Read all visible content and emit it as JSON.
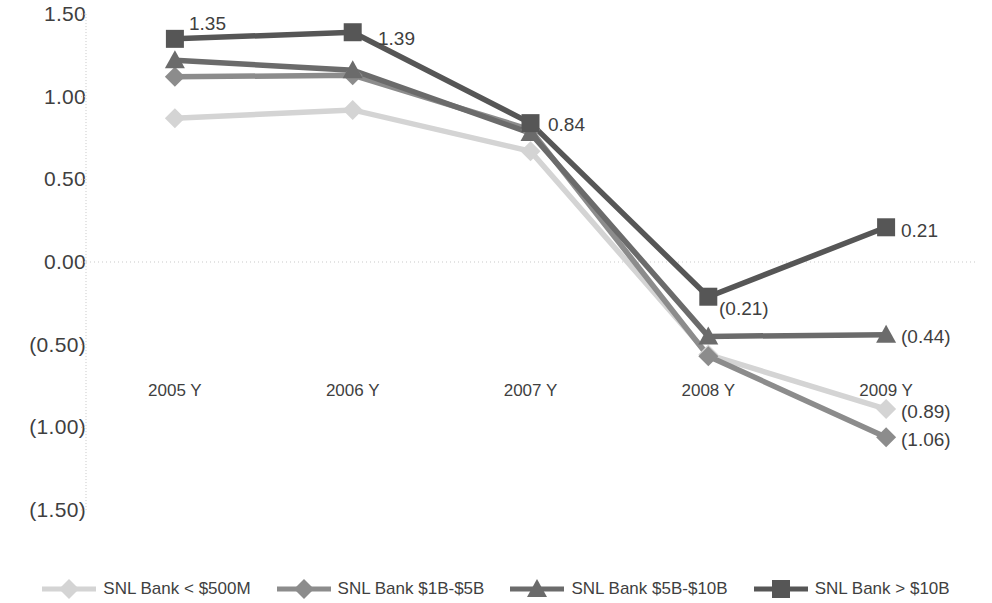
{
  "chart_data": {
    "type": "line",
    "title": "",
    "subtitle": "",
    "xlabel": "",
    "ylabel": "",
    "categories": [
      "2005 Y",
      "2006 Y",
      "2007 Y",
      "2008 Y",
      "2009 Y"
    ],
    "ylim": [
      -1.5,
      1.5
    ],
    "ytick_values": [
      1.5,
      1.0,
      0.5,
      0.0,
      -0.5,
      -1.0,
      -1.5
    ],
    "ytick_labels": [
      "1.50",
      "1.00",
      "0.50",
      "0.00",
      "(0.50)",
      "(1.00)",
      "(1.50)"
    ],
    "grid": false,
    "zero_line": true,
    "legend_position": "bottom",
    "series": [
      {
        "name": "SNL Bank < $500M",
        "color": "#d4d4d4",
        "marker": "diamond",
        "values": [
          0.87,
          0.92,
          0.67,
          -0.56,
          -0.89
        ]
      },
      {
        "name": "SNL Bank $1B-$5B",
        "color": "#8c8c8c",
        "marker": "diamond",
        "values": [
          1.12,
          1.13,
          0.8,
          -0.57,
          -1.06
        ]
      },
      {
        "name": "SNL Bank $5B-$10B",
        "color": "#6b6b6b",
        "marker": "triangle",
        "values": [
          1.22,
          1.16,
          0.78,
          -0.45,
          -0.44
        ]
      },
      {
        "name": "SNL Bank > $10B",
        "color": "#565656",
        "marker": "square",
        "values": [
          1.35,
          1.39,
          0.84,
          -0.21,
          0.21
        ]
      }
    ],
    "annotations": [
      {
        "text": "1.35",
        "series": "SNL Bank > $10B",
        "category": "2005 Y",
        "value": 1.35,
        "x": 189,
        "y": 24
      },
      {
        "text": "1.39",
        "series": "SNL Bank > $10B",
        "category": "2006 Y",
        "value": 1.39,
        "x": 378,
        "y": 39
      },
      {
        "text": "0.84",
        "series": "SNL Bank > $10B",
        "category": "2007 Y",
        "value": 0.84,
        "x": 548,
        "y": 125
      },
      {
        "text": "(0.21)",
        "series": "SNL Bank > $10B",
        "category": "2008 Y",
        "value": -0.21,
        "x": 719,
        "y": 309
      },
      {
        "text": "0.21",
        "series": "SNL Bank > $10B",
        "category": "2009 Y",
        "value": 0.21,
        "x": 901,
        "y": 231
      },
      {
        "text": "(0.44)",
        "series": "SNL Bank $5B-$10B",
        "category": "2009 Y",
        "value": -0.44,
        "x": 901,
        "y": 337
      },
      {
        "text": "(0.89)",
        "series": "SNL Bank < $500M",
        "category": "2009 Y",
        "value": -0.89,
        "x": 901,
        "y": 412
      },
      {
        "text": "(1.06)",
        "series": "SNL Bank $1B-$5B",
        "category": "2009 Y",
        "value": -1.06,
        "x": 901,
        "y": 440
      }
    ]
  },
  "geometry": {
    "plot_left": 86,
    "plot_right": 975,
    "y_top_px": 14,
    "y_zero_px": 262,
    "px_per_unit": 165.3,
    "x_label_y": 381
  },
  "colors": {
    "axis": "#c9c9c9",
    "text": "#3f3f3f",
    "background": "#ffffff"
  }
}
